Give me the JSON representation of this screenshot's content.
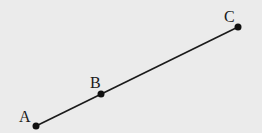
{
  "diagram": {
    "background": "#ebebeb",
    "line_color": "#1a1a1a",
    "points": [
      {
        "label": "A",
        "x": 36,
        "y": 126,
        "lx": 19,
        "ly": 122
      },
      {
        "label": "B",
        "x": 101,
        "y": 94,
        "lx": 90,
        "ly": 88
      },
      {
        "label": "C",
        "x": 238,
        "y": 27,
        "lx": 224,
        "ly": 22
      }
    ],
    "segment": {
      "from": "A",
      "to": "C"
    }
  }
}
